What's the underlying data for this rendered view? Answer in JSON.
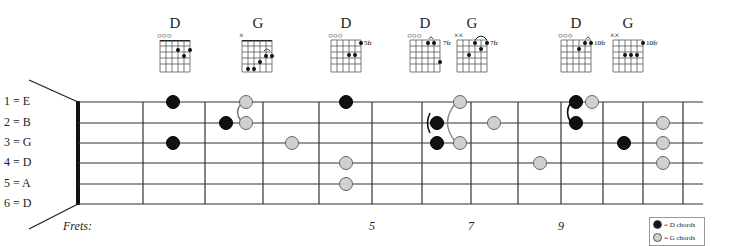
{
  "diagram": {
    "strings_labels": [
      "1 = E",
      "2 = B",
      "3 = G",
      "4 = D",
      "5 = A",
      "6 = D"
    ],
    "frets_label": "Frets:",
    "fret_numbers": [
      {
        "label": "5",
        "x": 369
      },
      {
        "label": "7",
        "x": 468
      },
      {
        "label": "9",
        "x": 558
      },
      {
        "label": "12",
        "x": 677
      }
    ],
    "colors": {
      "d_chord": "#111111",
      "g_chord": "#d0d0d0",
      "line": "#333333"
    },
    "fret_lines_x": [
      143,
      205,
      263,
      319,
      372,
      422,
      471,
      518,
      561,
      603,
      643,
      683
    ],
    "nut_x": 78,
    "string_y": [
      102,
      123,
      143,
      163,
      184,
      204
    ],
    "board_right_x": 703,
    "dots": [
      {
        "string": 1,
        "x": 173,
        "chord": "D"
      },
      {
        "string": 3,
        "x": 173,
        "chord": "D"
      },
      {
        "string": 2,
        "x": 226,
        "chord": "D"
      },
      {
        "string": 1,
        "x": 246,
        "chord": "G"
      },
      {
        "string": 2,
        "x": 246,
        "chord": "G"
      },
      {
        "string": 3,
        "x": 292,
        "chord": "G"
      },
      {
        "string": 1,
        "x": 346,
        "chord": "D"
      },
      {
        "string": 4,
        "x": 346,
        "chord": "G"
      },
      {
        "string": 5,
        "x": 346,
        "chord": "G"
      },
      {
        "string": 2,
        "x": 437,
        "chord": "D"
      },
      {
        "string": 3,
        "x": 437,
        "chord": "D"
      },
      {
        "string": 1,
        "x": 460,
        "chord": "G"
      },
      {
        "string": 3,
        "x": 460,
        "chord": "G"
      },
      {
        "string": 2,
        "x": 494,
        "chord": "G"
      },
      {
        "string": 4,
        "x": 540,
        "chord": "G"
      },
      {
        "string": 1,
        "x": 576,
        "chord": "D"
      },
      {
        "string": 2,
        "x": 576,
        "chord": "D"
      },
      {
        "string": 1,
        "x": 592,
        "chord": "G"
      },
      {
        "string": 3,
        "x": 624,
        "chord": "D"
      },
      {
        "string": 2,
        "x": 663,
        "chord": "G"
      },
      {
        "string": 3,
        "x": 663,
        "chord": "G"
      },
      {
        "string": 4,
        "x": 663,
        "chord": "G"
      }
    ],
    "legend": {
      "d_label": "= D chords",
      "g_label": "= G chords"
    }
  },
  "chord_boxes": [
    {
      "name": "D",
      "x": 160,
      "top_label": "○○○",
      "fret_label": ""
    },
    {
      "name": "G",
      "x": 242,
      "top_label": "×",
      "fret_label": ""
    },
    {
      "name": "D",
      "x": 331,
      "top_label": "○○○",
      "fret_label": "5fr"
    },
    {
      "name": "D",
      "x": 410,
      "top_label": "○○○",
      "fret_label": "7fr"
    },
    {
      "name": "G",
      "x": 457,
      "top_label": "××",
      "fret_label": "7fr"
    },
    {
      "name": "D",
      "x": 561,
      "top_label": "○○○",
      "fret_label": "10fr"
    },
    {
      "name": "G",
      "x": 613,
      "top_label": "××",
      "fret_label": "10fr"
    }
  ]
}
